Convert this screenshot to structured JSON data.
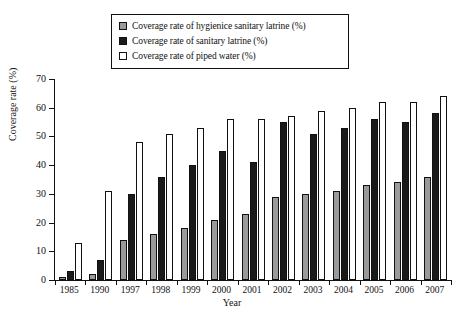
{
  "chart_data": {
    "type": "bar",
    "title": "",
    "xlabel": "Year",
    "ylabel": "Coverage rate (%)",
    "ylim": [
      0,
      70
    ],
    "yticks": [
      0,
      10,
      20,
      30,
      40,
      50,
      60,
      70
    ],
    "grid": false,
    "legend_position": "top-center",
    "categories": [
      "1985",
      "1990",
      "1997",
      "1998",
      "1999",
      "2000",
      "2001",
      "2002",
      "2003",
      "2004",
      "2005",
      "2006",
      "2007"
    ],
    "series": [
      {
        "name": "Coverage rate of hygienice sanitary latrine (%)",
        "key": "hyg",
        "color": "#9a9a9a",
        "values": [
          1,
          2,
          14,
          16,
          18,
          21,
          23,
          29,
          30,
          31,
          33,
          34,
          36
        ]
      },
      {
        "name": "Coverage rate of sanitary latrine (%)",
        "key": "san",
        "color": "#1a1a1a",
        "values": [
          3,
          7,
          30,
          36,
          40,
          45,
          41,
          55,
          51,
          53,
          56,
          55,
          58
        ]
      },
      {
        "name": "Coverage rate of piped water (%)",
        "key": "pip",
        "color": "#ffffff",
        "values": [
          13,
          31,
          48,
          51,
          53,
          56,
          56,
          57,
          59,
          60,
          62,
          62,
          64
        ]
      }
    ]
  },
  "legend": {
    "items": [
      {
        "label": "Coverage rate of hygienice sanitary latrine (%)",
        "swatch": "hyg"
      },
      {
        "label": "Coverage rate of sanitary latrine (%)",
        "swatch": "san"
      },
      {
        "label": "Coverage rate of piped water (%)",
        "swatch": "pip"
      }
    ]
  },
  "axes": {
    "y_title": "Coverage rate (%)",
    "x_title": "Year",
    "y_tick_labels": [
      "70",
      "60",
      "50",
      "40",
      "30",
      "20",
      "10",
      "0"
    ],
    "x_tick_labels": [
      "1985",
      "1990",
      "1997",
      "1998",
      "1999",
      "2000",
      "2001",
      "2002",
      "2003",
      "2004",
      "2005",
      "2006",
      "2007"
    ]
  }
}
